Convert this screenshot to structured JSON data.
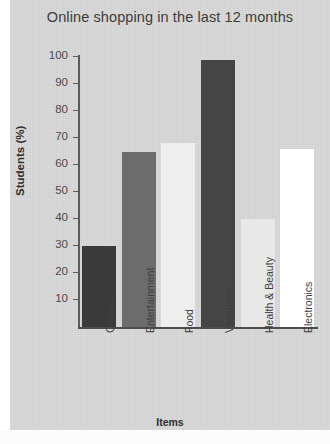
{
  "figure": {
    "background_color": "#d7d8d7",
    "page_color": "#ffffff"
  },
  "chart_data": {
    "type": "bar",
    "title": "Online shopping in the last 12 months",
    "xlabel": "Items",
    "ylabel": "Students (%)",
    "categories": [
      "Clothes",
      "Entertainment",
      "Food",
      "Vacations",
      "Health & Beauty",
      "Electronics"
    ],
    "values": [
      30,
      65,
      68,
      99,
      40,
      66
    ],
    "bar_colors": [
      "#3a3a3a",
      "#6c6c6c",
      "#eeeeee",
      "#454545",
      "#e7e8e7",
      "#ffffff"
    ],
    "ylim": [
      0,
      100
    ],
    "yticks": [
      10,
      20,
      30,
      40,
      50,
      60,
      70,
      80,
      90,
      100
    ],
    "ytick_labels": [
      "10",
      "20",
      "30",
      "40",
      "50",
      "60",
      "70",
      "80",
      "90",
      "100"
    ],
    "grid": false,
    "legend": null,
    "series": [
      {
        "name": "Students (%)",
        "values": [
          30,
          65,
          68,
          99,
          40,
          66
        ]
      }
    ]
  }
}
